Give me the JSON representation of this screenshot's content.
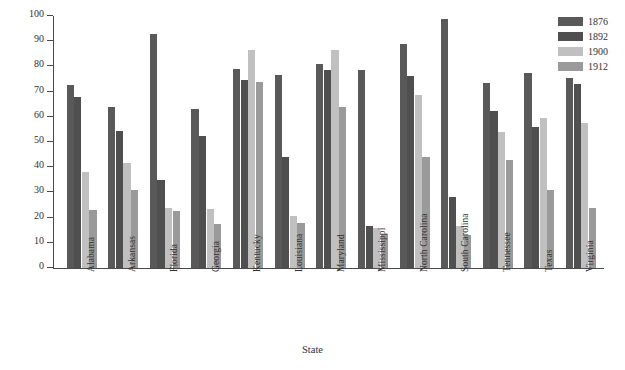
{
  "chart_data": {
    "type": "bar",
    "title": "",
    "xlabel": "State",
    "ylabel": "Percentage of Eligible Voters",
    "ylim": [
      0,
      100
    ],
    "ytick_step": 10,
    "yticks": [
      100,
      90,
      80,
      70,
      60,
      50,
      40,
      30,
      20,
      10,
      0
    ],
    "grid": false,
    "legend_position": "top-right",
    "categories": [
      "Alabama",
      "Arkansas",
      "Florida",
      "Georgia",
      "Kentucky",
      "Louisiana",
      "Maryland",
      "Mississippi",
      "North Carolina",
      "South Carolina",
      "Tennessee",
      "Texas",
      "Virginia"
    ],
    "series": [
      {
        "name": "1876",
        "color": "#595959",
        "values": [
          72.5,
          64,
          93,
          63,
          79,
          76.5,
          81,
          78.5,
          89,
          99,
          73.5,
          77.5,
          75.5
        ]
      },
      {
        "name": "1892",
        "color": "#4f4f4f",
        "values": [
          68,
          54.5,
          35,
          52.5,
          74.5,
          44,
          78.5,
          16.5,
          76,
          28,
          62.5,
          56,
          73
        ]
      },
      {
        "name": "1900",
        "color": "#c0c0c0",
        "values": [
          38,
          41.5,
          24,
          23.5,
          86.5,
          20.5,
          86.5,
          16,
          68.5,
          16.5,
          54,
          59.5,
          57.5
        ]
      },
      {
        "name": "1912",
        "color": "#9a9a9a",
        "values": [
          23,
          31,
          22.5,
          17.5,
          74,
          18,
          64,
          13.5,
          44,
          13,
          43,
          31,
          24
        ]
      }
    ]
  },
  "legend": {
    "entries": [
      {
        "label": "1876",
        "color": "#595959"
      },
      {
        "label": "1892",
        "color": "#4f4f4f"
      },
      {
        "label": "1900",
        "color": "#c0c0c0"
      },
      {
        "label": "1912",
        "color": "#9a9a9a"
      }
    ]
  }
}
